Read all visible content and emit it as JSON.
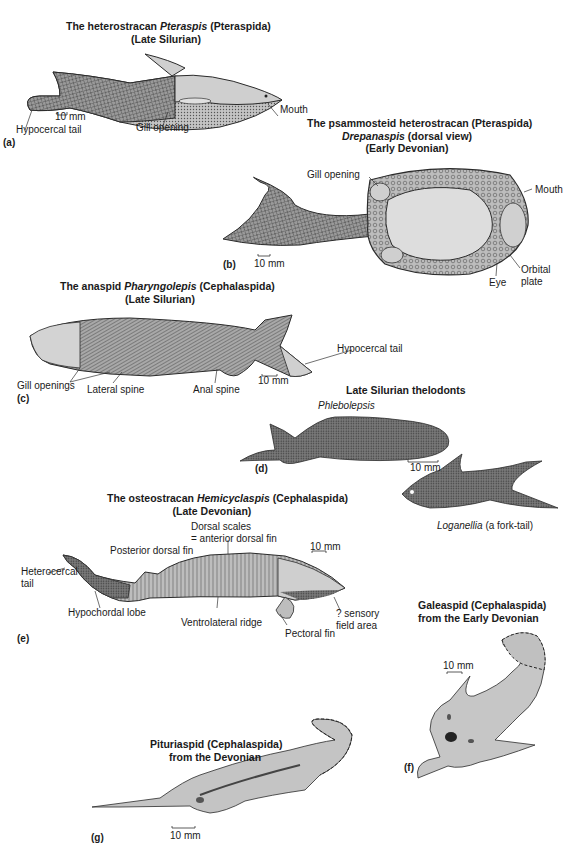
{
  "figure": {
    "panels": {
      "a": {
        "letter": "(a)",
        "title_prefix": "The heterostracan ",
        "title_italic": "Pteraspis",
        "title_suffix": " (Pteraspida)",
        "subtitle": "(Late Silurian)",
        "labels": {
          "tail": "Hypocercal tail",
          "gill": "Gill opening",
          "mouth": "Mouth",
          "scale": "10 mm"
        }
      },
      "b": {
        "letter": "(b)",
        "title_line1": "The psammosteid heterostracan (Pteraspida)",
        "title_italic": "Drepanaspis",
        "title_line2_suffix": " (dorsal view)",
        "subtitle": "(Early Devonian)",
        "labels": {
          "gill": "Gill opening",
          "mouth": "Mouth",
          "orbital_1": "Orbital",
          "orbital_2": "plate",
          "eye": "Eye",
          "scale": "10 mm"
        }
      },
      "c": {
        "letter": "(c)",
        "title_prefix": "The anaspid ",
        "title_italic": "Pharyngolepis",
        "title_suffix": " (Cephalaspida)",
        "subtitle": "(Late Silurian)",
        "labels": {
          "tail": "Hypocercal tail",
          "gills": "Gill openings",
          "lateral": "Lateral spine",
          "anal": "Anal spine",
          "scale": "10 mm"
        }
      },
      "d": {
        "letter": "(d)",
        "title": "Late Silurian thelodonts",
        "species_1": "Phlebolepsis",
        "species_2_italic": "Loganellia",
        "species_2_suffix": " (a fork-tail)",
        "labels": {
          "scale": "10 mm"
        }
      },
      "e": {
        "letter": "(e)",
        "title_prefix": "The osteostracan ",
        "title_italic": "Hemicyclaspis",
        "title_suffix": " (Cephalaspida)",
        "subtitle": "(Late Devonian)",
        "labels": {
          "dorsal_1": "Dorsal scales",
          "dorsal_2": "= anterior dorsal fin",
          "posterior": "Posterior dorsal fin",
          "tail_1": "Heterocercal",
          "tail_2": "tail",
          "hypochordal": "Hypochordal lobe",
          "ventrolateral": "Ventrolateral ridge",
          "pectoral": "Pectoral fin",
          "sensory_1": "? sensory",
          "sensory_2": "field area",
          "scale": "10 mm"
        }
      },
      "f": {
        "letter": "(f)",
        "title_line1": "Galeaspid (Cephalaspida)",
        "title_line2": "from the Early Devonian",
        "labels": {
          "scale": "10 mm"
        }
      },
      "g": {
        "letter": "(g)",
        "title_line1": "Pituriaspid (Cephalaspida)",
        "title_line2": "from the Devonian",
        "labels": {
          "scale": "10 mm"
        }
      }
    },
    "colors": {
      "body": "#b9b9b9",
      "body_light": "#d6d6d6",
      "outline": "#2b2b2b",
      "dark": "#555555"
    }
  }
}
